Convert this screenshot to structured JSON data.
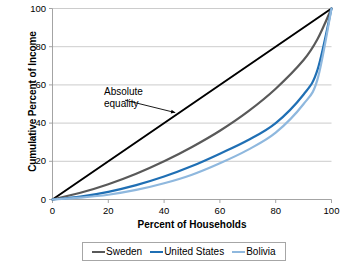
{
  "chart_data": {
    "type": "line",
    "title": "",
    "xlabel": "Percent of Households",
    "ylabel": "Cumulative Percent of Income",
    "xlim": [
      0,
      100
    ],
    "ylim": [
      0,
      100
    ],
    "xticks": [
      "0",
      "20",
      "40",
      "60",
      "80",
      "100"
    ],
    "yticks": [
      "0",
      "20",
      "40",
      "60",
      "80",
      "100"
    ],
    "grid": "horizontal",
    "legend_position": "bottom",
    "x": [
      0,
      10,
      20,
      30,
      40,
      50,
      60,
      70,
      80,
      90,
      95,
      100
    ],
    "series": [
      {
        "name": "Absolute equality",
        "color": "#000000",
        "in_legend": false,
        "values": [
          0,
          10,
          20,
          30,
          40,
          50,
          60,
          70,
          80,
          90,
          95,
          100
        ]
      },
      {
        "name": "Sweden",
        "color": "#595959",
        "in_legend": true,
        "values": [
          0,
          3.5,
          8,
          13.5,
          20,
          27.5,
          36,
          46,
          58,
          73,
          84,
          100
        ]
      },
      {
        "name": "United States",
        "color": "#1F6FB4",
        "in_legend": true,
        "values": [
          0,
          1.5,
          4,
          7.5,
          12,
          17.5,
          24,
          31,
          40,
          55,
          68,
          100
        ]
      },
      {
        "name": "Bolivia",
        "color": "#8FB8DE",
        "in_legend": true,
        "values": [
          0,
          1,
          2.5,
          5,
          8.5,
          13,
          19,
          26,
          35,
          50,
          63,
          100
        ]
      }
    ],
    "annotations": [
      {
        "text": "Absolute\nequality",
        "arrow_from": [
          26,
          52
        ],
        "arrow_to": [
          44,
          45.5
        ]
      }
    ]
  },
  "legend": {
    "items": [
      {
        "label": "Sweden",
        "color": "#595959"
      },
      {
        "label": "United States",
        "color": "#1F6FB4"
      },
      {
        "label": "Bolivia",
        "color": "#8FB8DE"
      }
    ]
  }
}
